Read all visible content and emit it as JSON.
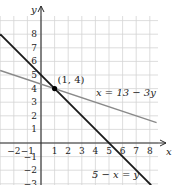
{
  "chart_data": {
    "type": "line",
    "title": "",
    "xlabel": "x",
    "ylabel": "y",
    "xlim": [
      -3,
      8.5
    ],
    "ylim": [
      -3,
      9
    ],
    "grid": true,
    "x_ticks": [
      -2,
      -1,
      1,
      2,
      3,
      4,
      5,
      6,
      7,
      8
    ],
    "y_ticks": [
      -3,
      -2,
      -1,
      1,
      2,
      3,
      4,
      5,
      6,
      7,
      8
    ],
    "series": [
      {
        "name": "5 − x = y",
        "equation": "y = 5 - x",
        "color": "#1a1a1a",
        "x": [
          -3.0,
          8.1
        ],
        "y": [
          8.0,
          -3.1
        ]
      },
      {
        "name": "x = 13 − 3y",
        "equation": "y = (13 - x) / 3",
        "color": "#8a8a8a",
        "x": [
          -3.0,
          8.5
        ],
        "y": [
          5.33,
          1.5
        ]
      }
    ],
    "annotations": [
      {
        "text": "(1, 4)",
        "x": 1,
        "y": 4,
        "type": "point",
        "color": "#000000"
      },
      {
        "text": "x = 13 − 3y",
        "x": 3.3,
        "y": 3.9
      },
      {
        "text": "5 − x = y",
        "x": 3.8,
        "y": -2.3
      }
    ]
  },
  "labels": {
    "x_axis": "x",
    "y_axis": "y",
    "point": "(1, 4)",
    "gray_line": "x = 13 − 3y",
    "black_line": "5 − x = y"
  },
  "colors": {
    "grid": "#d4d4d4",
    "axis": "#2a2a2a",
    "black_line": "#1a1a1a",
    "gray_line": "#8a8a8a"
  }
}
